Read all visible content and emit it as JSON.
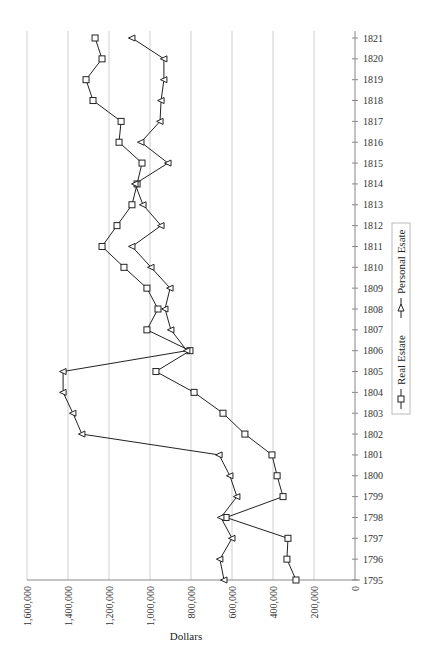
{
  "chart_data": {
    "type": "line",
    "orientation": "rotated-90",
    "title": "",
    "xlabel": "",
    "ylabel": "Dollars",
    "ylim": [
      0,
      1600000
    ],
    "y_ticks": [
      0,
      200000,
      400000,
      600000,
      800000,
      1000000,
      1200000,
      1400000,
      1600000
    ],
    "y_tick_labels": [
      "0",
      "200,000",
      "400,000",
      "600,000",
      "800,000",
      "1,000,000",
      "1,200,000",
      "1,400,000",
      "1,600,000"
    ],
    "grid": true,
    "legend_position": "right",
    "x": [
      1795,
      1796,
      1797,
      1798,
      1799,
      1800,
      1801,
      1802,
      1803,
      1804,
      1805,
      1806,
      1807,
      1808,
      1809,
      1810,
      1811,
      1812,
      1813,
      1814,
      1815,
      1816,
      1817,
      1818,
      1819,
      1820,
      1821
    ],
    "x_tick_labels": [
      "1795",
      "1796",
      "1797",
      "1798",
      "1799",
      "1800",
      "1801",
      "1802",
      "1803",
      "1804",
      "1805",
      "1806",
      "1807",
      "1808",
      "1809",
      "1810",
      "1811",
      "1812",
      "1813",
      "1814",
      "1815",
      "1816",
      "1817",
      "1818",
      "1819",
      "1820",
      "1821"
    ],
    "series": [
      {
        "name": "Real Estate",
        "marker": "square",
        "values": [
          288000,
          332000,
          327000,
          629000,
          351000,
          380000,
          405000,
          537000,
          644000,
          785000,
          971000,
          805000,
          1015000,
          961000,
          1015000,
          1127000,
          1234000,
          1161000,
          1088000,
          1063000,
          1039000,
          1151000,
          1141000,
          1278000,
          1312000,
          1234000,
          1268000
        ]
      },
      {
        "name": "Personal Esate",
        "marker": "triangle",
        "values": [
          639000,
          659000,
          600000,
          654000,
          576000,
          610000,
          663000,
          1332000,
          1376000,
          1424000,
          1424000,
          820000,
          898000,
          927000,
          902000,
          995000,
          1088000,
          946000,
          1034000,
          1073000,
          912000,
          1044000,
          951000,
          946000,
          932000,
          932000,
          1088000
        ]
      }
    ],
    "colors": {
      "line": "#222222",
      "marker_fill": "#ffffff",
      "grid": "#cfcfcf",
      "axis": "#888888"
    }
  }
}
